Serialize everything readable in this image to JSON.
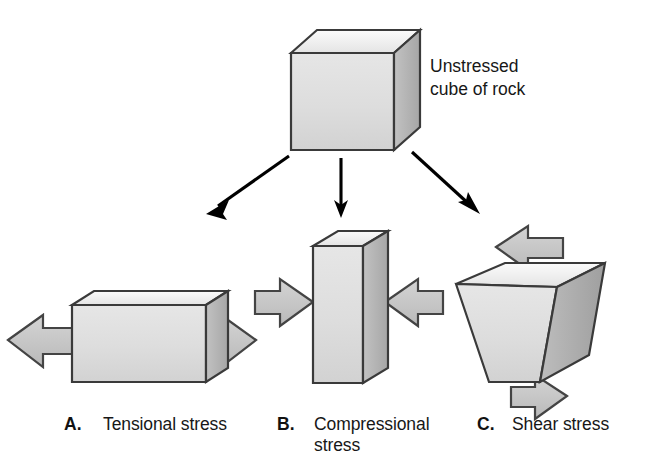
{
  "figure": {
    "background_color": "#ffffff"
  },
  "source_cube": {
    "label_line1": "Unstressed",
    "label_line2": "cube of rock",
    "label_full": "Unstressed cube of rock",
    "icon": "cube-3d-icon"
  },
  "palette": {
    "front_face": "#dcdcdc",
    "top_face": "#f4f4f4",
    "side_face": "#b3b3b3",
    "outline": "#3a3a3a",
    "block_arrow_fill": "#c6c6c6",
    "block_arrow_outline": "#444444",
    "connector_arrow": "#000000",
    "text": "#171717"
  },
  "connectors": [
    {
      "name": "arrow-to-tensional",
      "direction": "down-left",
      "target": "A"
    },
    {
      "name": "arrow-to-compressional",
      "direction": "down",
      "target": "B"
    },
    {
      "name": "arrow-to-shear",
      "direction": "down-right",
      "target": "C"
    }
  ],
  "panels": [
    {
      "letter": "A.",
      "label": "Tensional stress",
      "label_lines": [
        "Tensional stress"
      ],
      "deformation": "elongated / stretched block",
      "force_arrows": [
        {
          "name": "tension-arrow-left",
          "direction": "left",
          "points": "outward"
        },
        {
          "name": "tension-arrow-right",
          "direction": "right",
          "points": "outward"
        }
      ]
    },
    {
      "letter": "B.",
      "label": "Compressional stress",
      "label_lines": [
        "Compressional",
        "stress"
      ],
      "deformation": "shortened / squeezed tall block",
      "force_arrows": [
        {
          "name": "compression-arrow-left",
          "direction": "right",
          "points": "inward"
        },
        {
          "name": "compression-arrow-right",
          "direction": "left",
          "points": "inward"
        }
      ]
    },
    {
      "letter": "C.",
      "label": "Shear stress",
      "label_lines": [
        "Shear stress"
      ],
      "deformation": "skewed / sheared cube",
      "force_arrows": [
        {
          "name": "shear-arrow-top",
          "direction": "left",
          "points": "opposing"
        },
        {
          "name": "shear-arrow-bottom",
          "direction": "right",
          "points": "opposing"
        }
      ]
    }
  ]
}
